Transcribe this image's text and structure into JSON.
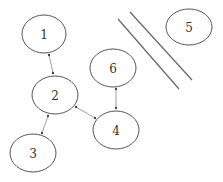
{
  "diagram": {
    "type": "node-graph",
    "nodes": [
      {
        "id": "1",
        "label": "1",
        "cx": 44,
        "cy": 34,
        "rx": 22,
        "ry": 19
      },
      {
        "id": "2",
        "label": "2",
        "cx": 55,
        "cy": 95,
        "rx": 23,
        "ry": 19
      },
      {
        "id": "3",
        "label": "3",
        "cx": 33,
        "cy": 153,
        "rx": 23,
        "ry": 19
      },
      {
        "id": "4",
        "label": "4",
        "cx": 116,
        "cy": 130,
        "rx": 23,
        "ry": 19
      },
      {
        "id": "5",
        "label": "5",
        "cx": 189,
        "cy": 27,
        "rx": 23,
        "ry": 18
      },
      {
        "id": "6",
        "label": "6",
        "cx": 113,
        "cy": 68,
        "rx": 23,
        "ry": 19
      }
    ],
    "edges": [
      {
        "from": "1",
        "to": "2",
        "bidirectional": true,
        "x1": 49,
        "y1": 55,
        "x2": 53,
        "y2": 73
      },
      {
        "from": "2",
        "to": "3",
        "bidirectional": true,
        "x1": 48,
        "y1": 116,
        "x2": 42,
        "y2": 133
      },
      {
        "from": "2",
        "to": "4",
        "bidirectional": true,
        "x1": 76,
        "y1": 107,
        "x2": 95,
        "y2": 118
      },
      {
        "from": "6",
        "to": "4",
        "bidirectional": true,
        "x1": 116,
        "y1": 89,
        "x2": 116,
        "y2": 108
      }
    ],
    "barrier_lines": [
      {
        "x1": 118,
        "y1": 19,
        "x2": 179,
        "y2": 89
      },
      {
        "x1": 130,
        "y1": 12,
        "x2": 192,
        "y2": 80
      }
    ],
    "colors": {
      "node_stroke": "#555555",
      "edge_stroke": "#888888",
      "label": "#333333",
      "barrier": "#666666"
    }
  }
}
